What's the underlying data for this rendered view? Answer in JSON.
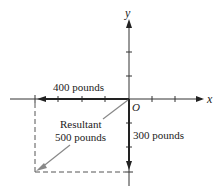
{
  "diagram": {
    "type": "vector-addition",
    "axes": {
      "x_label": "x",
      "y_label": "y",
      "origin_label": "O"
    },
    "vectors": [
      {
        "name": "horizontal-force",
        "label": "400 pounds",
        "direction": "negative-x",
        "magnitude": 400
      },
      {
        "name": "vertical-force",
        "label": "300 pounds",
        "direction": "negative-y",
        "magnitude": 300
      },
      {
        "name": "resultant",
        "label_line1": "Resultant",
        "label_line2": "500 pounds",
        "magnitude": 500
      }
    ],
    "colors": {
      "axis": "#333333",
      "vector": "#222222",
      "resultant": "#888888",
      "dashed": "#555555"
    }
  }
}
